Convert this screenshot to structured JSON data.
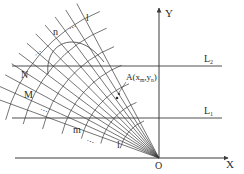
{
  "diagram": {
    "axes": {
      "x_label": "X",
      "y_label": "Y",
      "origin_label": "O"
    },
    "lines": {
      "upper": {
        "label": "L",
        "sub": "2"
      },
      "lower": {
        "label": "L",
        "sub": "1"
      }
    },
    "point": {
      "prefix": "A(x",
      "sub1": "m",
      "mid": ",y",
      "sub2": "n",
      "suffix": ")"
    },
    "grid_labels": {
      "n": "n",
      "l_top": "l",
      "N": "N",
      "M": "M",
      "m": "m",
      "l_bottom": "l",
      "ellipsis": "…"
    },
    "colors": {
      "stroke": "#3a3a3a",
      "text": "#2a2a2a",
      "background": "#ffffff"
    }
  }
}
